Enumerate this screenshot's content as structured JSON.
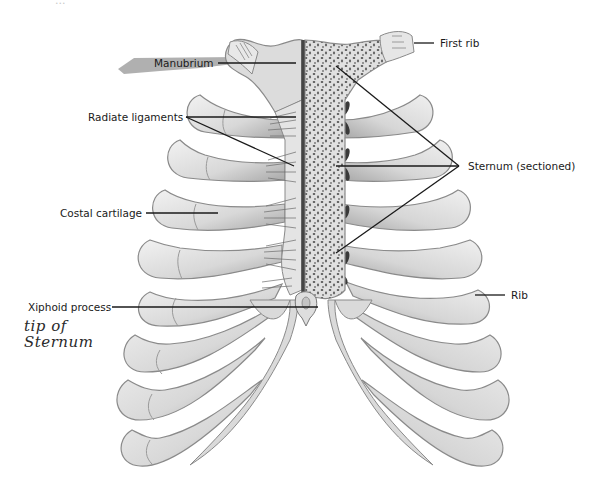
{
  "figure": {
    "title_fragment": "...",
    "colors": {
      "background": "#ffffff",
      "bone_light": "#e6e6e6",
      "bone_mid": "#cfcfcf",
      "bone_shadow": "#9a9a9a",
      "bone_outline": "#8a8a8a",
      "sternum_section": "#d9d9d9",
      "sternum_dots": "#555555",
      "leader_line": "#1a1a1a",
      "manubrium_highlight": "#9c9c9c"
    }
  },
  "labels": {
    "manubrium": "Manubrium",
    "first_rib": "First rib",
    "radiate_ligaments": "Radiate ligaments",
    "sternum_sectioned": "Sternum (sectioned)",
    "costal_cartilage": "Costal cartilage",
    "rib": "Rib",
    "xiphoid_process": "Xiphoid process"
  },
  "annotations": {
    "handwritten_note": "tip of\nSternum"
  }
}
